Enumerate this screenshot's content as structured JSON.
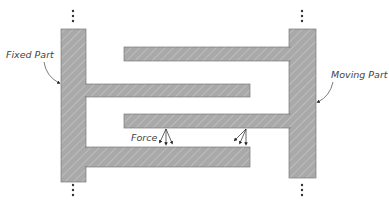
{
  "diagram": {
    "type": "comb-drive schematic",
    "labels": {
      "fixed": "Fixed Part",
      "moving": "Moving Part",
      "force": "Force"
    },
    "colors": {
      "fill": "#a9a9a9",
      "hatch": "#bdbdbd",
      "stroke": "#7a7a7a",
      "text": "#444444",
      "arrow": "#222222"
    },
    "continuation_marks": "⋮"
  }
}
